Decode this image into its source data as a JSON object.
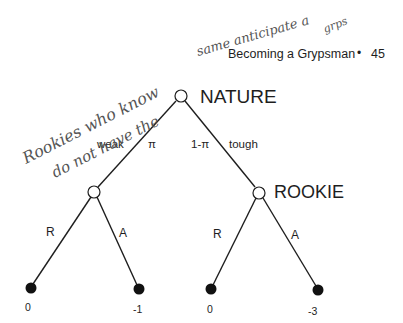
{
  "header": {
    "title": "Becoming a Grypsman",
    "separator": "•",
    "page_number": "45"
  },
  "handwritten": {
    "line1": "Rookies who know",
    "line2": "do not have the",
    "line3": "same anticipate a",
    "line4": "grps"
  },
  "tree": {
    "root": {
      "label": "NATURE"
    },
    "branches": {
      "left_label": "weak",
      "left_prob": "π",
      "right_prob": "1-π",
      "right_label": "tough"
    },
    "player": {
      "label": "ROOKIE"
    },
    "actions": {
      "left_r": "R",
      "left_a": "A",
      "right_r": "R",
      "right_a": "A"
    },
    "payoffs": [
      "0",
      "-1",
      "0",
      "-3"
    ]
  },
  "colors": {
    "ink": "#1e1e1e",
    "pencil": "#555555",
    "background": "#ffffff"
  }
}
